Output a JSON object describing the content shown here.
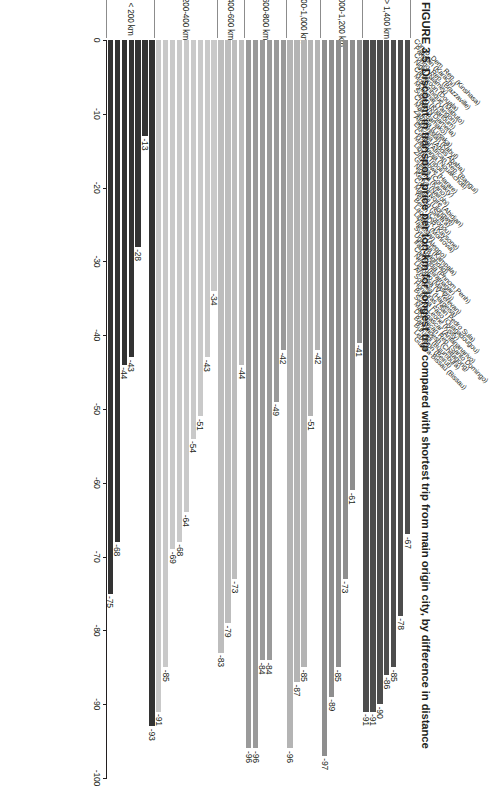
{
  "title": {
    "figure_number": "FIGURE 3.5",
    "text": "Discount in transport price per ton-km for longest trip compared with shortest trip from main origin city, by difference in distance"
  },
  "axis": {
    "ticks": [
      0,
      -10,
      -20,
      -30,
      -40,
      -50,
      -60,
      -70,
      -80,
      -90,
      -100
    ],
    "tick_labels": [
      "0",
      "-10",
      "-20",
      "-30",
      "-40",
      "-50",
      "-60",
      "-70",
      "-80",
      "-90",
      "-100"
    ],
    "min": -100,
    "max": 0
  },
  "colors": {
    "group_1400_plus": "#4d4d4d",
    "group_1000_1200": "#8e8e8e",
    "group_800_1000": "#b4b4b4",
    "group_600_800": "#9a9a9a",
    "group_400_600": "#bdbdbd",
    "group_200_400": "#c9c9c9",
    "group_under_200": "#333333",
    "axis": "#231f20",
    "rule": "#8c8c8c"
  },
  "chart_data": {
    "type": "bar",
    "orientation": "horizontal",
    "title": "Discount in transport price per ton-km for longest trip compared with shortest trip from main origin city, by difference in distance",
    "xlabel": "",
    "ylabel": "",
    "xlim": [
      -100,
      0
    ],
    "grid": false,
    "legend": "none",
    "group_label_name": "difference in distance",
    "groups": [
      {
        "label": "> 1,400 km",
        "color": "#4d4d4d",
        "categories": [
          "Congo, Dem. Rep. (Kinshasa)",
          "Pakistan (Karachi)",
          "Congo, Rep. (Brazzaville)",
          "Niger (Niamey)",
          "Cameroon (Douala)",
          "Mozambique (Maputo)",
          "Myanmar (Yangon)"
        ],
        "values": [
          -67,
          -78,
          -85,
          -86,
          -90,
          -91,
          -91
        ]
      },
      {
        "label": "1,000-1,200 km",
        "color": "#8e8e8e",
        "categories": [
          "Sudan (Khartoum)",
          "Chad (N'Djamena)",
          "Mali (Bamako)",
          "Zambia (Lusaka)",
          "Afghanistan (Kabul)",
          "Ethiopia (Addis Ababa)"
        ],
        "values": [
          -41,
          -61,
          -73,
          -85,
          -89,
          -97
        ]
      },
      {
        "label": "800-1,000 km",
        "color": "#b4b4b4",
        "categories": [
          "Central African Rep. (Bangui)",
          "Mauritania (Nouakchott)",
          "Libya (Tripoli)",
          "Zimbabwe (Harare)",
          "Guinea (Conakry)"
        ],
        "values": [
          -42,
          -51,
          -85,
          -87,
          -96
        ]
      },
      {
        "label": "600-800 km",
        "color": "#9a9a9a",
        "categories": [
          "Nigeria (Kano)",
          "Kenya (Nairobi)",
          "Cote d'Ivoire (Abidjan)",
          "Malawi (Lilongwe)",
          "Yemen (Sana'a)",
          "Benin (Cotonou)"
        ],
        "values": [
          -42,
          -49,
          -84,
          -84,
          -96,
          -96
        ]
      },
      {
        "label": "400-600 km",
        "color": "#bdbdbd",
        "categories": [
          "Lao PDR (Kaysone)",
          "Liberia (Monrovia)",
          "Tajikistan",
          "Syria (Aleppo)"
        ],
        "values": [
          -44,
          -73,
          -79,
          -83
        ]
      },
      {
        "label": "200-400 km",
        "color": "#c9c9c9",
        "categories": [
          "Uganda (Kampala)",
          "Iraq (Baghdad)",
          "Cambodia (Phnom Penh)",
          "Nepal (Biratnagar)",
          "Lesotho (Maseru)",
          "Armenia (V. Yerevan)",
          "Somalia (Hargeisa)",
          "Honduras (San Pedro Sula)",
          "Burkina Faso (Ouagadougou)"
        ],
        "values": [
          -34,
          -43,
          -51,
          -54,
          -64,
          -68,
          -69,
          -85,
          -91
        ]
      },
      {
        "label": "< 200 km",
        "color": "#333333",
        "categories": [
          "Sierra Leone (Kissy)",
          "Madagascar (Antananarivo)",
          "Dominican Rep. (Santo Domingo)",
          "Bangladesh (Chittagong)",
          "Burundi (Bujumbura)",
          "Lebanon (Beirut)",
          "Guinea-Bissau (Bissau)"
        ],
        "values": [
          -93,
          -13,
          -28,
          -43,
          -44,
          -68,
          -75
        ]
      }
    ]
  }
}
